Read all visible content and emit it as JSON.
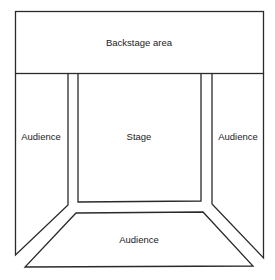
{
  "diagram": {
    "type": "theatre-floor-plan",
    "regions": {
      "backstage": {
        "label": "Backstage area"
      },
      "stage": {
        "label": "Stage"
      },
      "audience_left": {
        "label": "Audience"
      },
      "audience_right": {
        "label": "Audience"
      },
      "audience_front": {
        "label": "Audience"
      }
    },
    "colors": {
      "line": "#2a2a2a",
      "background": "#ffffff",
      "text": "#1a1a1a"
    }
  }
}
